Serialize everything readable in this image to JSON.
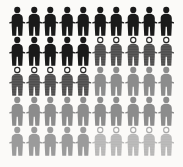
{
  "graphic": {
    "title": "People pictogram grid",
    "kind": "pictogram-infographic",
    "background_color": "#fbfaf8",
    "columns": 10,
    "rows": 5,
    "icon_name": "person-figure-icon",
    "styles": {
      "black_solid": {
        "label": "black solid person",
        "fill": "#1a1a1a",
        "head": "solid",
        "pattern": "none"
      },
      "black_dotted": {
        "label": "black dotted person",
        "fill": "#262626",
        "head": "ring",
        "pattern": "dots",
        "dot_color": "#fbfaf8"
      },
      "gray_solid": {
        "label": "gray solid person",
        "fill": "#8c8c8c",
        "head": "solid",
        "pattern": "none"
      },
      "light_gray_solid": {
        "label": "light gray solid person",
        "fill": "#9b9b9b",
        "head": "solid",
        "pattern": "none"
      },
      "light_gray_dotted": {
        "label": "light gray dotted person",
        "fill": "#a8a8a8",
        "head": "ring",
        "pattern": "dots",
        "dot_color": "#fbfaf8"
      }
    },
    "rows_data": [
      {
        "row_label": "row-1",
        "cells": [
          "black_solid",
          "black_solid",
          "black_solid",
          "black_solid",
          "black_solid",
          "black_solid",
          "black_solid",
          "black_solid",
          "black_solid",
          "black_solid"
        ]
      },
      {
        "row_label": "row-2",
        "cells": [
          "black_solid",
          "black_solid",
          "black_solid",
          "black_solid",
          "black_solid",
          "black_dotted",
          "black_dotted",
          "black_dotted",
          "black_dotted",
          "black_dotted"
        ]
      },
      {
        "row_label": "row-3",
        "cells": [
          "black_dotted",
          "black_dotted",
          "black_dotted",
          "black_dotted",
          "black_dotted",
          "gray_solid",
          "gray_solid",
          "gray_solid",
          "gray_solid",
          "gray_solid"
        ]
      },
      {
        "row_label": "row-4",
        "cells": [
          "gray_solid",
          "gray_solid",
          "gray_solid",
          "gray_solid",
          "gray_solid",
          "gray_solid",
          "gray_solid",
          "gray_solid",
          "gray_solid",
          "gray_solid"
        ]
      },
      {
        "row_label": "row-5",
        "cells": [
          "light_gray_solid",
          "light_gray_solid",
          "light_gray_solid",
          "light_gray_solid",
          "light_gray_solid",
          "light_gray_dotted",
          "light_gray_dotted",
          "light_gray_dotted",
          "light_gray_dotted",
          "light_gray_dotted"
        ]
      }
    ],
    "counts": {
      "total_figures": 50,
      "black_solid": 15,
      "black_dotted": 10,
      "gray_solid": 15,
      "light_gray_solid": 5,
      "light_gray_dotted": 5
    }
  }
}
